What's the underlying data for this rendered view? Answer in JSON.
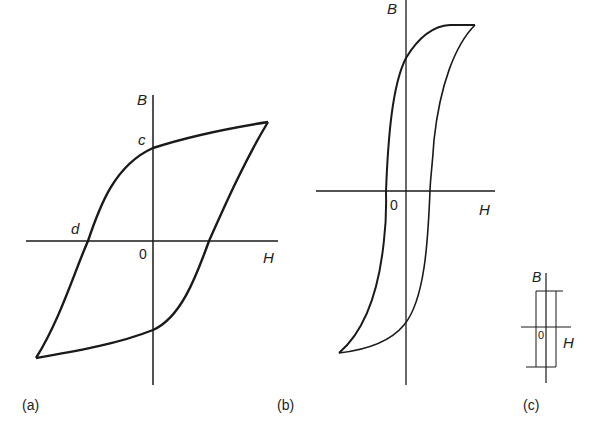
{
  "figure": {
    "colors": {
      "stroke": "#1a1a1a",
      "text": "#222222",
      "background": "#ffffff"
    },
    "panels": [
      {
        "id": "a",
        "caption": "(a)",
        "y_axis_label": "B",
        "x_axis_label": "H",
        "origin_label": "0",
        "point_labels": {
          "remanence": "c",
          "coercivity": "d"
        }
      },
      {
        "id": "b",
        "caption": "(b)",
        "y_axis_label": "B",
        "x_axis_label": "H",
        "origin_label": "0"
      },
      {
        "id": "c",
        "caption": "(c)",
        "y_axis_label": "B",
        "x_axis_label": "H",
        "origin_label": "0"
      }
    ]
  }
}
